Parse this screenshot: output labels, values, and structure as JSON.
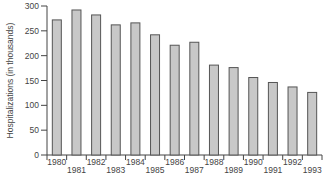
{
  "chart_data": {
    "type": "bar",
    "title": "",
    "xlabel": "",
    "ylabel": "Hospitalizations (in thousands)",
    "ylim": [
      0,
      300
    ],
    "yticks": [
      0,
      50,
      100,
      150,
      200,
      250,
      300
    ],
    "grid": false,
    "legend": null,
    "categories": [
      "1980",
      "1981",
      "1982",
      "1983",
      "1984",
      "1985",
      "1986",
      "1987",
      "1988",
      "1989",
      "1990",
      "1991",
      "1992",
      "1993"
    ],
    "values": [
      272,
      292,
      282,
      262,
      266,
      242,
      221,
      227,
      181,
      176,
      156,
      146,
      137,
      126
    ],
    "colors": {
      "bar_fill": "#c8c8c8",
      "bar_stroke": "#555555",
      "axis": "#444444",
      "text": "#444444"
    }
  }
}
